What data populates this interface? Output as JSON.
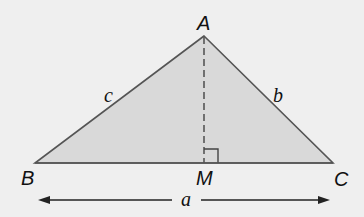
{
  "diagram": {
    "colors": {
      "background": "#efefef",
      "triangle_fill": "#d9d9d9",
      "stroke": "#555555",
      "text": "#111111"
    },
    "vertices": {
      "A": {
        "label": "A",
        "x": 204,
        "y": 36
      },
      "B": {
        "label": "B",
        "x": 35,
        "y": 163
      },
      "C": {
        "label": "C",
        "x": 333,
        "y": 163
      },
      "M": {
        "label": "M",
        "x": 204,
        "y": 163
      }
    },
    "sides": {
      "a": {
        "label": "a",
        "between": [
          "B",
          "C"
        ]
      },
      "b": {
        "label": "b",
        "between": [
          "A",
          "C"
        ]
      },
      "c": {
        "label": "c",
        "between": [
          "A",
          "B"
        ]
      }
    },
    "altitude": {
      "from": "A",
      "to": "M",
      "style": "dashed"
    },
    "right_angle_marker": {
      "at": "M"
    },
    "dimension_arrow": {
      "label": "a",
      "from_x": 38,
      "to_x": 330,
      "y": 200
    }
  }
}
